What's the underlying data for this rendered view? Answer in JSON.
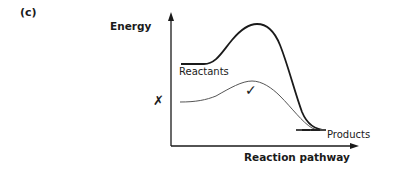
{
  "part_label": "(c)",
  "axes": {
    "y_label": "Energy",
    "x_label": "Reaction pathway"
  },
  "curves": {
    "uncatalysed": {
      "style": "thick",
      "description": "higher activation energy path"
    },
    "catalysed": {
      "style": "thin",
      "description": "lower activation energy path"
    }
  },
  "labels": {
    "reactants": "Reactants",
    "products": "Products"
  },
  "marks": {
    "cross": "✗",
    "tick": "✓"
  },
  "colors": {
    "ink": "#1a1a1a",
    "thin_curve": "#555555"
  }
}
